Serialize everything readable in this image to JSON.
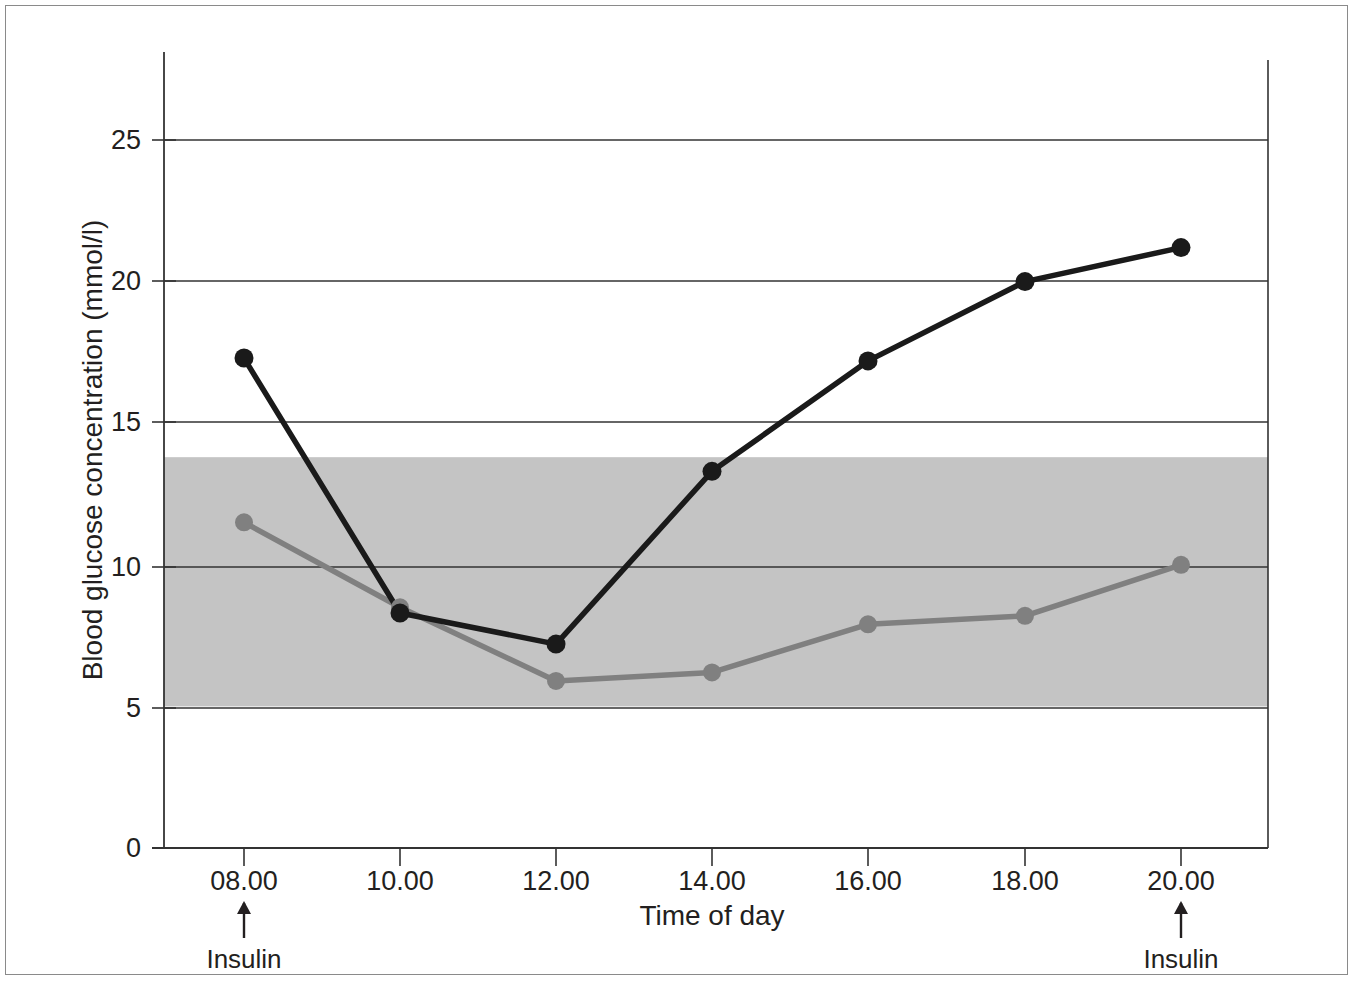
{
  "figure": {
    "background_color": "#ffffff",
    "frame_color": "#8a8a8a"
  },
  "chart_data": {
    "type": "line",
    "title": "",
    "xlabel": "Time of day",
    "ylabel": "Blood glucose concentration (mmol/l)",
    "x": [
      "08.00",
      "10.00",
      "12.00",
      "14.00",
      "16.00",
      "18.00",
      "20.00"
    ],
    "categories": [
      "08.00",
      "10.00",
      "12.00",
      "14.00",
      "16.00",
      "18.00",
      "20.00"
    ],
    "xtick_labels": [
      "08.00",
      "10.00",
      "12.00",
      "14.00",
      "16.00",
      "18.00",
      "20.00"
    ],
    "ytick_labels": [
      "0",
      "5",
      "10",
      "15",
      "20",
      "25"
    ],
    "ytick_values": [
      0,
      5,
      10,
      15,
      20,
      25
    ],
    "ylim": [
      0,
      27.5
    ],
    "grid": "horizontal",
    "legend": "none",
    "series": [
      {
        "name": "black-line",
        "color": "#1a1a1a",
        "marker": "circle",
        "values": [
          17.3,
          8.3,
          7.2,
          13.3,
          17.2,
          20.0,
          21.2
        ]
      },
      {
        "name": "grey-line",
        "color": "#808080",
        "marker": "circle",
        "values": [
          11.5,
          8.5,
          5.9,
          6.2,
          7.9,
          8.2,
          10.0
        ]
      }
    ],
    "shaded_band": {
      "name": "normal-range-band",
      "color": "#c4c4c4",
      "y_min": 5.0,
      "y_max": 13.8
    },
    "annotations": [
      {
        "label": "Insulin",
        "x": "08.00"
      },
      {
        "label": "Insulin",
        "x": "20.00"
      }
    ]
  }
}
